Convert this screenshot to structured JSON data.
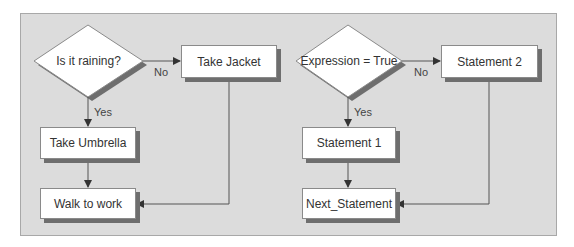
{
  "flowcharts": [
    {
      "decision": "Is it raining?",
      "no_branch": "Take Jacket",
      "yes_branch": "Take Umbrella",
      "end": "Walk to work",
      "no_label": "No",
      "yes_label": "Yes"
    },
    {
      "decision": "Expression = True",
      "no_branch": "Statement 2",
      "yes_branch": "Statement 1",
      "end": "Next_Statement",
      "no_label": "No",
      "yes_label": "Yes"
    }
  ],
  "colors": {
    "panel_bg": "#dcdcdc",
    "box_bg": "#ffffff",
    "shadow": "#6e6e6e",
    "line": "#555555"
  }
}
